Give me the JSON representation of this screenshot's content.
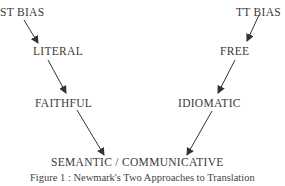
{
  "diagram": {
    "nodes": {
      "st_bias": "ST BIAS",
      "tt_bias": "TT BIAS",
      "literal": "LITERAL",
      "free": "FREE",
      "faithful": "FAITHFUL",
      "idiomatic": "IDIOMATIC",
      "semantic_communicative": "SEMANTIC / COMMUNICATIVE"
    },
    "edges": [
      {
        "from": "ST BIAS",
        "to": "LITERAL"
      },
      {
        "from": "LITERAL",
        "to": "FAITHFUL"
      },
      {
        "from": "FAITHFUL",
        "to": "SEMANTIC / COMMUNICATIVE"
      },
      {
        "from": "TT BIAS",
        "to": "FREE"
      },
      {
        "from": "FREE",
        "to": "IDIOMATIC"
      },
      {
        "from": "IDIOMATIC",
        "to": "SEMANTIC / COMMUNICATIVE"
      }
    ],
    "caption": "Figure 1 : Newmark's Two Approaches to Translation",
    "line_color": "#333333"
  }
}
